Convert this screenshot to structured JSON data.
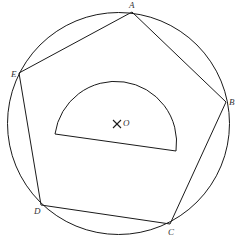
{
  "figure": {
    "type": "geometry-diagram",
    "stroke_color": "#1a1a1a",
    "background": "#ffffff"
  },
  "circle": {
    "cx": 118.5,
    "cy": 123.5,
    "r": 111
  },
  "vertices": [
    {
      "name": "A",
      "x": 132,
      "y": 12,
      "label_x": 131,
      "label_y": 8
    },
    {
      "name": "B",
      "x": 226,
      "y": 102,
      "label_x": 229,
      "label_y": 105
    },
    {
      "name": "C",
      "x": 170,
      "y": 224,
      "label_x": 171,
      "label_y": 235
    },
    {
      "name": "D",
      "x": 41,
      "y": 205,
      "label_x": 33,
      "label_y": 214
    },
    {
      "name": "E",
      "x": 19,
      "y": 73,
      "label_x": 11,
      "label_y": 77
    }
  ],
  "center": {
    "name": "O",
    "x": 117,
    "y": 124,
    "label_x": 123,
    "label_y": 126
  },
  "semicircle": {
    "start_x": 55,
    "start_y": 134,
    "end_x": 176,
    "end_y": 151,
    "radius": 61
  },
  "labels": {
    "A": "A",
    "B": "B",
    "C": "C",
    "D": "D",
    "E": "E",
    "O": "O"
  }
}
